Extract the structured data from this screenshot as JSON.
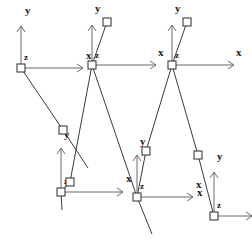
{
  "figure": {
    "type": "robotics-frame-diagram",
    "width": 252,
    "height": 250,
    "background_color": "#ffffff",
    "axis_color": "#6b6b6b",
    "link_color": "#3a3a3a",
    "joint_fill_color": "#ffffff",
    "joint_stroke_color": "#2a2a2a",
    "label_color": "#1a1a1a"
  },
  "labels": {
    "x": "x",
    "y": "y",
    "z": "z"
  },
  "frames": [
    {
      "id": "frame-1",
      "origin": [
        21,
        68
      ],
      "y_axis_length": 42,
      "x_axis_length": 62,
      "x_label_pos": [
        86,
        59
      ],
      "y_label_pos": [
        25,
        14
      ],
      "z_label_pos": [
        24,
        60
      ]
    },
    {
      "id": "frame-2",
      "origin": [
        92,
        65
      ],
      "y_axis_length": 40,
      "x_axis_length": 64,
      "x_label_pos": [
        158,
        56
      ],
      "y_label_pos": [
        95,
        12
      ],
      "z_label_pos": [
        95,
        58
      ]
    },
    {
      "id": "frame-3",
      "origin": [
        172,
        65
      ],
      "y_axis_length": 40,
      "x_axis_length": 62,
      "x_label_pos": [
        236,
        56
      ],
      "y_label_pos": [
        175,
        12
      ],
      "z_label_pos": [
        175,
        58
      ]
    },
    {
      "id": "frame-4",
      "origin": [
        61,
        192
      ],
      "y_axis_length": 44,
      "x_axis_length": 62,
      "x_label_pos": [
        126,
        182
      ],
      "y_label_pos": [
        64,
        138
      ],
      "z_label_pos": [
        64,
        184
      ]
    },
    {
      "id": "frame-5",
      "origin": [
        137,
        197
      ],
      "y_axis_length": 42,
      "x_axis_length": 56,
      "x_label_pos": [
        196,
        188
      ],
      "y_label_pos": [
        140,
        145
      ],
      "z_label_pos": [
        140,
        189
      ]
    },
    {
      "id": "frame-6",
      "origin": [
        214,
        216
      ],
      "y_axis_length": 44,
      "x_axis_length": 38,
      "x_label_pos": [
        197,
        196
      ],
      "y_label_pos": [
        217,
        160
      ],
      "z_label_pos": [
        217,
        208
      ]
    }
  ],
  "joints": [
    {
      "id": "joint-1",
      "pos": [
        21,
        68
      ]
    },
    {
      "id": "joint-2",
      "pos": [
        63,
        130
      ]
    },
    {
      "id": "joint-3",
      "pos": [
        92,
        65
      ]
    },
    {
      "id": "joint-4",
      "pos": [
        107,
        22
      ]
    },
    {
      "id": "joint-5",
      "pos": [
        70,
        182
      ]
    },
    {
      "id": "joint-6",
      "pos": [
        137,
        197
      ]
    },
    {
      "id": "joint-7",
      "pos": [
        146,
        151
      ]
    },
    {
      "id": "joint-8",
      "pos": [
        172,
        65
      ]
    },
    {
      "id": "joint-9",
      "pos": [
        187,
        22
      ]
    },
    {
      "id": "joint-10",
      "pos": [
        198,
        155
      ]
    },
    {
      "id": "joint-11",
      "pos": [
        214,
        216
      ]
    },
    {
      "id": "joint-12",
      "pos": [
        61,
        192
      ]
    }
  ],
  "links": [
    {
      "id": "link-1",
      "from": [
        21,
        68
      ],
      "to": [
        63,
        130
      ]
    },
    {
      "id": "link-2",
      "from": [
        63,
        130
      ],
      "to": [
        88,
        168
      ]
    },
    {
      "id": "link-3",
      "from": [
        107,
        22
      ],
      "to": [
        92,
        65
      ]
    },
    {
      "id": "link-4",
      "from": [
        92,
        65
      ],
      "to": [
        70,
        182
      ]
    },
    {
      "id": "link-5",
      "from": [
        70,
        182
      ],
      "to": [
        61,
        192
      ]
    },
    {
      "id": "link-6",
      "from": [
        61,
        192
      ],
      "to": [
        62,
        210
      ]
    },
    {
      "id": "link-7",
      "from": [
        92,
        65
      ],
      "to": [
        137,
        197
      ]
    },
    {
      "id": "link-8",
      "from": [
        137,
        197
      ],
      "to": [
        146,
        151
      ]
    },
    {
      "id": "link-9",
      "from": [
        146,
        151
      ],
      "to": [
        172,
        65
      ]
    },
    {
      "id": "link-10",
      "from": [
        187,
        22
      ],
      "to": [
        172,
        65
      ]
    },
    {
      "id": "link-11",
      "from": [
        172,
        65
      ],
      "to": [
        198,
        155
      ]
    },
    {
      "id": "link-12",
      "from": [
        198,
        155
      ],
      "to": [
        214,
        216
      ]
    },
    {
      "id": "link-13",
      "from": [
        137,
        197
      ],
      "to": [
        152,
        234
      ]
    }
  ]
}
